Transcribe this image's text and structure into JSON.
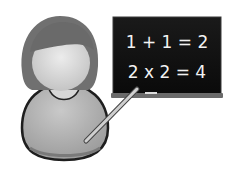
{
  "illustration": {
    "subject": "teacher",
    "board": {
      "lines": [
        "1 + 1 = 2",
        "2 x 2 = 4"
      ]
    }
  },
  "colors": {
    "background": "#ffffff",
    "board": "#111111",
    "board_frame": "#5a5a5a",
    "chalk": "#f2f2f2",
    "hair": "#6e6e6e",
    "face": "#d9d9d9",
    "shirt": "#b3b3b3",
    "outline": "#222222",
    "pointer": "#c8c8c8"
  }
}
